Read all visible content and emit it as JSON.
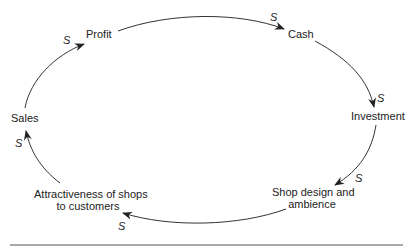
{
  "diagram": {
    "type": "causal-loop",
    "nodes": [
      {
        "id": "sales",
        "label": "Sales"
      },
      {
        "id": "profit",
        "label": "Profit"
      },
      {
        "id": "cash",
        "label": "Cash"
      },
      {
        "id": "investment",
        "label": "Investment"
      },
      {
        "id": "shop_design",
        "label_line1": "Shop design and",
        "label_line2": "ambience"
      },
      {
        "id": "attractiveness",
        "label_line1": "Attractiveness of shops",
        "label_line2": "to customers"
      }
    ],
    "links": [
      {
        "from": "sales",
        "to": "profit",
        "polarity": "S"
      },
      {
        "from": "profit",
        "to": "cash",
        "polarity": "S"
      },
      {
        "from": "cash",
        "to": "investment",
        "polarity": "S"
      },
      {
        "from": "investment",
        "to": "shop_design",
        "polarity": "S"
      },
      {
        "from": "shop_design",
        "to": "attractiveness",
        "polarity": "S"
      },
      {
        "from": "attractiveness",
        "to": "sales",
        "polarity": "S"
      }
    ],
    "colors": {
      "line": "#333333",
      "text": "#222222",
      "rule": "#555555"
    }
  }
}
